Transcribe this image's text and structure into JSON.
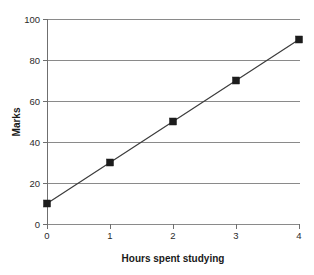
{
  "chart_data": {
    "type": "line",
    "title": "",
    "subtitle": "",
    "xlabel": "Hours spent studying",
    "ylabel": "Marks",
    "x": [
      0,
      1,
      2,
      3,
      4
    ],
    "values": [
      10,
      30,
      50,
      70,
      90
    ],
    "series": [
      {
        "name": "Marks vs hours",
        "x": [
          0,
          1,
          2,
          3,
          4
        ],
        "values": [
          10,
          30,
          50,
          70,
          90
        ]
      }
    ],
    "xlim": [
      0,
      4
    ],
    "ylim": [
      0,
      100
    ],
    "x_ticks": [
      "0",
      "1",
      "2",
      "3",
      "4"
    ],
    "y_ticks": [
      "0",
      "20",
      "40",
      "60",
      "80",
      "100"
    ],
    "grid": "horizontal",
    "legend": "none",
    "marker": "square",
    "colors": {
      "line": "#3c3c3c",
      "marker": "#1c1c1c",
      "grid": "#8a8a8a",
      "axis": "#6f6f6f",
      "text": "#2b2b2b",
      "background": "#ffffff"
    }
  },
  "axes": {
    "y_tick_labels": [
      "100",
      "80",
      "60",
      "40",
      "20",
      "0"
    ],
    "x_tick_labels": [
      "0",
      "1",
      "2",
      "3",
      "4"
    ],
    "y_axis_title": "Marks",
    "x_axis_title": "Hours spent studying"
  }
}
